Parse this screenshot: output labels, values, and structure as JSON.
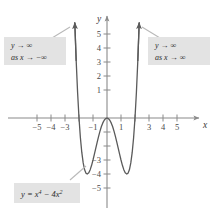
{
  "figure": {
    "background": "#ffffff",
    "curve_color": "#4a4a4a",
    "axis_color": "#8a8a8a",
    "callout_fill": "#e3e3e3",
    "callout_text_color": "#2b2b2b"
  },
  "axes": {
    "x_axis_label": "x",
    "y_axis_label": "y",
    "x_ticks": [
      {
        "value": -5,
        "label": "−5",
        "visible": true
      },
      {
        "value": -4,
        "label": "−4",
        "visible": true
      },
      {
        "value": -3,
        "label": "−3",
        "visible": true
      },
      {
        "value": -2,
        "label": "−2",
        "visible": false
      },
      {
        "value": -1,
        "label": "−1",
        "visible": true
      },
      {
        "value": 1,
        "label": "1",
        "visible": true
      },
      {
        "value": 2,
        "label": "2",
        "visible": false
      },
      {
        "value": 3,
        "label": "3",
        "visible": true
      },
      {
        "value": 4,
        "label": "4",
        "visible": true
      },
      {
        "value": 5,
        "label": "5",
        "visible": true
      }
    ],
    "y_ticks": [
      {
        "value": 5,
        "label": "5",
        "visible": true
      },
      {
        "value": 4,
        "label": "4",
        "visible": true
      },
      {
        "value": 3,
        "label": "3",
        "visible": true
      },
      {
        "value": 2,
        "label": "2",
        "visible": true
      },
      {
        "value": 1,
        "label": "1",
        "visible": true
      },
      {
        "value": -1,
        "label": "−1",
        "visible": false
      },
      {
        "value": -2,
        "label": "−2",
        "visible": false
      },
      {
        "value": -3,
        "label": "−3",
        "visible": true
      },
      {
        "value": -4,
        "label": "−4",
        "visible": true
      },
      {
        "value": -5,
        "label": "−5",
        "visible": true
      }
    ]
  },
  "callouts": {
    "left": {
      "line1": "y → ∞",
      "line2": "as x → −∞"
    },
    "right": {
      "line1": "y → ∞",
      "line2": "as x → ∞"
    },
    "equation": {
      "prefix": "y = x",
      "exp1": "4",
      "middle": " − 4x",
      "exp2": "2"
    }
  },
  "chart_data": {
    "type": "line",
    "xlabel": "x",
    "ylabel": "y",
    "xlim": [
      -5.8,
      7.6
    ],
    "ylim": [
      -5.8,
      6.2
    ],
    "grid": false,
    "legend": "none",
    "function": "y = x^4 - 4x^2",
    "series": [
      {
        "name": "y = x^4 - 4x^2",
        "x": [
          -2.3,
          -2.2,
          -2.1,
          -2.0,
          -1.9,
          -1.8,
          -1.7,
          -1.6,
          -1.5,
          -1.414,
          -1.3,
          -1.2,
          -1.1,
          -1.0,
          -0.9,
          -0.8,
          -0.7,
          -0.6,
          -0.5,
          -0.4,
          -0.3,
          -0.2,
          -0.1,
          0.0,
          0.1,
          0.2,
          0.3,
          0.4,
          0.5,
          0.6,
          0.7,
          0.8,
          0.9,
          1.0,
          1.1,
          1.2,
          1.3,
          1.414,
          1.5,
          1.6,
          1.7,
          1.8,
          1.9,
          2.0,
          2.1,
          2.2,
          2.3
        ],
        "y": [
          6.81,
          4.07,
          1.82,
          0.0,
          -1.41,
          -2.46,
          -3.21,
          -3.7,
          -3.94,
          -4.0,
          -3.91,
          -3.69,
          -3.38,
          -3.0,
          -2.58,
          -2.15,
          -1.72,
          -1.31,
          -0.94,
          -0.61,
          -0.35,
          -0.16,
          -0.04,
          0.0,
          -0.04,
          -0.16,
          -0.35,
          -0.61,
          -0.94,
          -1.31,
          -1.72,
          -2.15,
          -2.58,
          -3.0,
          -3.38,
          -3.69,
          -3.91,
          -4.0,
          -3.94,
          -3.7,
          -3.21,
          -2.46,
          -1.41,
          0.0,
          1.82,
          4.07,
          6.81
        ]
      }
    ],
    "annotations": [
      {
        "text": "y → ∞ as x → −∞",
        "position": "upper-left"
      },
      {
        "text": "y → ∞ as x → ∞",
        "position": "upper-right"
      },
      {
        "text": "y = x⁴ − 4x²",
        "position": "lower-left"
      }
    ],
    "key_points": {
      "roots": [
        -2,
        0,
        2
      ],
      "minima": [
        {
          "x": -1.414,
          "y": -4
        },
        {
          "x": 1.414,
          "y": -4
        }
      ],
      "local_max": [
        {
          "x": 0,
          "y": 0
        }
      ]
    }
  }
}
